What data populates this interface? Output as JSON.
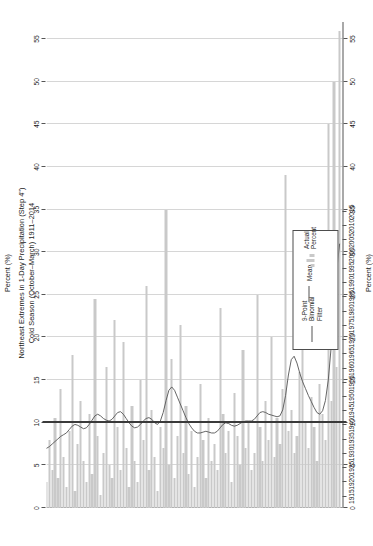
{
  "chart_data": {
    "type": "bar",
    "title": "Northeast Extremes in 1-Day Precipitation (Step 4\")\nCold Season (October–March) 1911–2014",
    "title_line1": "Northeast Extremes in 1-Day Precipitation (Step 4\")",
    "title_line2": "Cold Season (October–March) 1911–2014",
    "xlabel": "",
    "ylabel": "Percent (%)",
    "ylabel_top": "Percent (%)",
    "ylim": [
      0,
      57
    ],
    "xlim": [
      1911,
      2015
    ],
    "yticks": [
      0,
      5,
      10,
      15,
      20,
      25,
      30,
      35,
      40,
      45,
      50,
      55
    ],
    "ytick_labels": [
      "0",
      "5",
      "10",
      "15",
      "20",
      "25",
      "30",
      "35",
      "40",
      "45",
      "50",
      "55"
    ],
    "xticks": [
      1915,
      1920,
      1925,
      1930,
      1935,
      1940,
      1945,
      1950,
      1955,
      1960,
      1965,
      1970,
      1975,
      1980,
      1985,
      1990,
      1995,
      2000,
      2005,
      2010,
      2015
    ],
    "xtick_labels": [
      "1915",
      "1920",
      "1925",
      "1930",
      "1935",
      "1940",
      "1945",
      "1950",
      "1955",
      "1960",
      "1965",
      "1970",
      "1975",
      "1980",
      "1985",
      "1990",
      "1995",
      "2000",
      "2005",
      "2010",
      "2015"
    ],
    "grid": true,
    "legend_position": "lower-center",
    "mean_value": 10.0,
    "bar_color": "#c9c9c9",
    "line_color": "#555555",
    "mean_color": "#3a3a3a",
    "grid_color": "#d6d6d6",
    "years": [
      1911,
      1912,
      1913,
      1914,
      1915,
      1916,
      1917,
      1918,
      1919,
      1920,
      1921,
      1922,
      1923,
      1924,
      1925,
      1926,
      1927,
      1928,
      1929,
      1930,
      1931,
      1932,
      1933,
      1934,
      1935,
      1936,
      1937,
      1938,
      1939,
      1940,
      1941,
      1942,
      1943,
      1944,
      1945,
      1946,
      1947,
      1948,
      1949,
      1950,
      1951,
      1952,
      1953,
      1954,
      1955,
      1956,
      1957,
      1958,
      1959,
      1960,
      1961,
      1962,
      1963,
      1964,
      1965,
      1966,
      1967,
      1968,
      1969,
      1970,
      1971,
      1972,
      1973,
      1974,
      1975,
      1976,
      1977,
      1978,
      1979,
      1980,
      1981,
      1982,
      1983,
      1984,
      1985,
      1986,
      1987,
      1988,
      1989,
      1990,
      1991,
      1992,
      1993,
      1994,
      1995,
      1996,
      1997,
      1998,
      1999,
      2000,
      2001,
      2002,
      2003,
      2004,
      2005,
      2006,
      2007,
      2008,
      2009,
      2010,
      2011,
      2012,
      2013,
      2014
    ],
    "series": [
      {
        "name": "Actual Percent",
        "type": "bar",
        "values": [
          3.0,
          8.0,
          4.5,
          10.5,
          3.5,
          14.0,
          6.0,
          2.5,
          9.0,
          18.0,
          2.0,
          7.5,
          12.5,
          5.5,
          3.0,
          11.0,
          4.0,
          24.5,
          8.5,
          1.5,
          6.5,
          16.5,
          5.0,
          3.5,
          22.0,
          9.5,
          4.5,
          19.5,
          7.0,
          2.5,
          12.0,
          5.5,
          3.0,
          15.0,
          8.0,
          26.0,
          4.5,
          11.5,
          6.0,
          2.0,
          9.5,
          7.0,
          35.0,
          5.0,
          17.5,
          3.5,
          8.5,
          21.5,
          6.5,
          12.0,
          4.0,
          9.0,
          2.5,
          6.0,
          14.5,
          8.0,
          3.5,
          10.5,
          5.5,
          7.5,
          4.5,
          23.5,
          11.0,
          6.5,
          9.0,
          3.0,
          13.5,
          8.5,
          5.0,
          18.5,
          7.0,
          10.0,
          4.5,
          6.5,
          25.0,
          9.5,
          5.5,
          12.5,
          8.0,
          20.0,
          6.0,
          10.5,
          7.5,
          14.0,
          39.0,
          9.0,
          11.5,
          6.5,
          8.5,
          16.0,
          26.5,
          10.0,
          7.0,
          13.0,
          9.5,
          5.5,
          14.5,
          11.0,
          8.0,
          45.0,
          12.5,
          50.0,
          16.5,
          56.0
        ]
      },
      {
        "name": "9-Point Binomial Filter",
        "type": "line",
        "values": [
          7.0,
          7.2,
          7.5,
          7.8,
          8.1,
          8.4,
          8.6,
          8.8,
          9.2,
          9.6,
          9.8,
          9.7,
          9.5,
          9.3,
          9.4,
          9.8,
          10.3,
          10.8,
          11.0,
          10.8,
          10.5,
          10.3,
          10.2,
          10.4,
          10.8,
          11.2,
          11.3,
          11.0,
          10.5,
          10.0,
          9.6,
          9.4,
          9.5,
          9.8,
          10.2,
          10.5,
          10.6,
          10.4,
          10.0,
          9.8,
          10.2,
          11.2,
          12.6,
          13.8,
          14.2,
          13.8,
          13.0,
          12.2,
          11.4,
          10.6,
          9.9,
          9.4,
          9.0,
          8.8,
          8.8,
          8.9,
          9.0,
          8.9,
          8.8,
          8.8,
          9.0,
          9.4,
          9.8,
          10.0,
          9.9,
          9.7,
          9.6,
          9.7,
          9.9,
          10.1,
          10.2,
          10.2,
          10.2,
          10.4,
          10.8,
          11.2,
          11.3,
          11.2,
          11.0,
          10.9,
          10.8,
          10.7,
          10.8,
          11.5,
          13.2,
          15.6,
          17.4,
          17.8,
          17.0,
          15.8,
          14.8,
          14.0,
          13.2,
          12.5,
          11.8,
          11.2,
          11.0,
          11.4,
          12.6,
          15.0,
          18.8,
          23.6,
          28.0,
          31.0
        ]
      },
      {
        "name": "Mean",
        "type": "hline",
        "value": 10.0
      }
    ],
    "legend": [
      {
        "label": "9-Point\nBinomial\nFilter",
        "marker": "line"
      },
      {
        "label": "Mean",
        "marker": "line"
      },
      {
        "label": "Actual\nPercent",
        "marker": "bar"
      }
    ]
  }
}
